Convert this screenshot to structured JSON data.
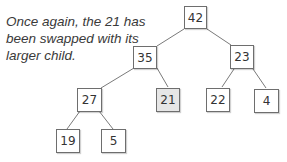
{
  "caption": {
    "lines": [
      "Once again, the 21 has",
      "been swapped with its",
      "larger child."
    ]
  },
  "tree": {
    "highlight_color": "#e6e6e6",
    "nodes": [
      {
        "id": "n42",
        "value": "42"
      },
      {
        "id": "n35",
        "value": "35"
      },
      {
        "id": "n23",
        "value": "23"
      },
      {
        "id": "n27",
        "value": "27"
      },
      {
        "id": "n21",
        "value": "21",
        "highlighted": true
      },
      {
        "id": "n22",
        "value": "22"
      },
      {
        "id": "n4",
        "value": "4"
      },
      {
        "id": "n19",
        "value": "19"
      },
      {
        "id": "n5",
        "value": "5"
      }
    ],
    "edges": [
      [
        "42",
        "35"
      ],
      [
        "42",
        "23"
      ],
      [
        "35",
        "27"
      ],
      [
        "35",
        "21"
      ],
      [
        "23",
        "22"
      ],
      [
        "23",
        "4"
      ],
      [
        "27",
        "19"
      ],
      [
        "27",
        "5"
      ]
    ]
  }
}
